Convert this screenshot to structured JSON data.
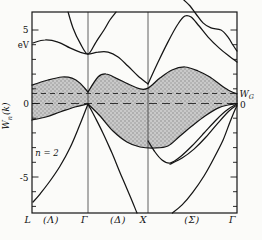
{
  "figure": {
    "kind": "electron band structure plot",
    "n_label": "n = 2"
  },
  "chart_data": {
    "type": "line",
    "ylabel": "W_n(k) [eV]",
    "ylim": [
      -7.45,
      6.22
    ],
    "xlim": [
      0,
      1
    ],
    "grid": false,
    "layout": {
      "x0": 32,
      "x1": 237,
      "y_top": 12,
      "y_bottom": 213,
      "zero_y": 103.5,
      "px_per_ev": 14.7
    },
    "kpoints": [
      {
        "label": "L",
        "k": 0
      },
      {
        "label": "Γ",
        "k": 0.273
      },
      {
        "label": "X",
        "k": 0.566
      },
      {
        "label": "Γ",
        "k": 1
      }
    ],
    "axis_labels": [
      {
        "text": "L"
      },
      {
        "text": "(Λ)"
      },
      {
        "text": "Γ"
      },
      {
        "text": "(Δ)"
      },
      {
        "text": "X"
      },
      {
        "text": "(Σ)"
      },
      {
        "text": "Γ"
      }
    ],
    "yaxis": {
      "unit": "eV",
      "title_main": "W",
      "title_sub": "n",
      "title_rest": "(k)",
      "ticks_major": [
        {
          "label": "5",
          "E": 5
        },
        {
          "label": "0",
          "E": 0
        },
        {
          "label": "-5",
          "E": -5
        }
      ],
      "ticks_minor": [
        4,
        3,
        2,
        1,
        -1,
        -2,
        -3,
        -4,
        -6,
        -7
      ]
    },
    "fermi_level": {
      "label_main": "W",
      "label_sub": "G",
      "E": 0.68
    },
    "zero_line": {
      "label": "0",
      "E": 0
    },
    "annotation": {
      "text": "n = 2",
      "k": 0.068,
      "E": -3.35
    },
    "shaded_region": {
      "upper": [
        "shade-top-lambda",
        "shade-top-delta-sigma"
      ],
      "lower": [
        "shade-bottom-lambda",
        "shade-bottom-delta-sigma"
      ],
      "fill_base": "#c9c9c9",
      "fill_dot": "#8f8f8f"
    },
    "series": [
      {
        "name": "upper-band",
        "points": [
          [
            0.005,
            4.12
          ],
          [
            0.063,
            4.32
          ],
          [
            0.127,
            4.18
          ],
          [
            0.185,
            3.78
          ],
          [
            0.234,
            3.5
          ],
          [
            0.273,
            3.37
          ],
          [
            0.322,
            3.5
          ],
          [
            0.371,
            3.5
          ],
          [
            0.42,
            3.16
          ],
          [
            0.468,
            2.55
          ],
          [
            0.517,
            1.87
          ],
          [
            0.566,
            1.33
          ]
        ]
      },
      {
        "name": "sigma-peak-band",
        "points": [
          [
            0.566,
            1.33
          ],
          [
            0.615,
            2.82
          ],
          [
            0.663,
            4.18
          ],
          [
            0.712,
            5.41
          ],
          [
            0.746,
            5.95
          ],
          [
            0.776,
            5.88
          ],
          [
            0.815,
            5.27
          ],
          [
            0.859,
            4.52
          ],
          [
            0.912,
            3.78
          ],
          [
            0.961,
            3.23
          ],
          [
            1,
            2.82
          ]
        ]
      },
      {
        "name": "gamma-parabola",
        "points": [
          [
            0.176,
            6.22
          ],
          [
            0.2,
            5.14
          ],
          [
            0.234,
            4.12
          ],
          [
            0.273,
            3.37
          ],
          [
            0.312,
            4.18
          ],
          [
            0.351,
            5.0
          ],
          [
            0.38,
            5.68
          ],
          [
            0.41,
            6.22
          ]
        ]
      },
      {
        "name": "top-entrant-band",
        "points": [
          [
            0.741,
            7.04
          ],
          [
            0.771,
            6.63
          ],
          [
            0.8,
            6.09
          ],
          [
            0.834,
            5.48
          ],
          [
            0.873,
            5.14
          ],
          [
            0.922,
            5.0
          ],
          [
            0.956,
            4.52
          ],
          [
            0.98,
            3.98
          ],
          [
            1,
            3.57
          ]
        ]
      },
      {
        "name": "shade-top-lambda",
        "points": [
          [
            0,
            1.26
          ],
          [
            0.078,
            1.6
          ],
          [
            0.146,
            1.8
          ],
          [
            0.195,
            1.73
          ],
          [
            0.234,
            1.39
          ],
          [
            0.273,
            0.78
          ]
        ]
      },
      {
        "name": "shade-top-delta-sigma",
        "points": [
          [
            0.273,
            0.78
          ],
          [
            0.322,
            1.8
          ],
          [
            0.361,
            2.01
          ],
          [
            0.41,
            1.73
          ],
          [
            0.468,
            1.33
          ],
          [
            0.527,
            0.99
          ],
          [
            0.566,
            1.05
          ],
          [
            0.624,
            1.73
          ],
          [
            0.683,
            2.28
          ],
          [
            0.746,
            2.48
          ],
          [
            0.81,
            2.21
          ],
          [
            0.868,
            1.8
          ],
          [
            0.927,
            1.19
          ],
          [
            0.966,
            0.85
          ],
          [
            1,
            0.65
          ]
        ]
      },
      {
        "name": "shade-bottom-lambda",
        "points": [
          [
            0,
            -1.12
          ],
          [
            0.068,
            -0.92
          ],
          [
            0.137,
            -0.58
          ],
          [
            0.21,
            -0.24
          ],
          [
            0.273,
            -0.03
          ]
        ]
      },
      {
        "name": "shade-bottom-delta-sigma",
        "points": [
          [
            0.273,
            -0.03
          ],
          [
            0.332,
            -0.85
          ],
          [
            0.395,
            -1.87
          ],
          [
            0.463,
            -2.62
          ],
          [
            0.527,
            -2.96
          ],
          [
            0.6,
            -3.03
          ],
          [
            0.663,
            -2.89
          ],
          [
            0.722,
            -2.21
          ],
          [
            0.78,
            -1.53
          ],
          [
            0.844,
            -0.85
          ],
          [
            0.907,
            -0.31
          ],
          [
            0.956,
            -0.1
          ],
          [
            1,
            0
          ]
        ]
      },
      {
        "name": "n2-band-lambda",
        "points": [
          [
            0.005,
            -6.7
          ],
          [
            0.039,
            -6.16
          ],
          [
            0.088,
            -5.27
          ],
          [
            0.137,
            -4.25
          ],
          [
            0.185,
            -3.03
          ],
          [
            0.229,
            -1.6
          ],
          [
            0.273,
            -0.03
          ]
        ]
      },
      {
        "name": "delta-steep-band",
        "points": [
          [
            0.273,
            -0.03
          ],
          [
            0.307,
            -0.92
          ],
          [
            0.346,
            -2.01
          ],
          [
            0.39,
            -3.37
          ],
          [
            0.434,
            -4.86
          ],
          [
            0.478,
            -6.29
          ],
          [
            0.512,
            -7.45
          ]
        ]
      },
      {
        "name": "x-parabola",
        "points": [
          [
            0.566,
            -2.55
          ],
          [
            0.6,
            -3.3
          ],
          [
            0.634,
            -3.84
          ],
          [
            0.673,
            -4.05
          ],
          [
            0.722,
            -3.64
          ],
          [
            0.78,
            -2.89
          ],
          [
            0.839,
            -2.01
          ],
          [
            0.898,
            -1.12
          ],
          [
            0.951,
            -0.44
          ],
          [
            1,
            -0.03
          ]
        ]
      },
      {
        "name": "x-parabola-upper-branch",
        "points": [
          [
            0.673,
            -4.12
          ],
          [
            0.732,
            -3.71
          ],
          [
            0.79,
            -3.1
          ],
          [
            0.849,
            -2.28
          ],
          [
            0.907,
            -1.33
          ],
          [
            0.961,
            -0.51
          ],
          [
            1,
            -0.1
          ]
        ]
      },
      {
        "name": "deep-sigma-band",
        "points": [
          [
            0.685,
            -7.45
          ],
          [
            0.732,
            -6.9
          ],
          [
            0.785,
            -6.02
          ],
          [
            0.839,
            -4.93
          ],
          [
            0.888,
            -3.71
          ],
          [
            0.932,
            -2.48
          ],
          [
            0.966,
            -1.26
          ],
          [
            0.99,
            -0.44
          ],
          [
            1,
            -0.17
          ]
        ]
      }
    ]
  }
}
